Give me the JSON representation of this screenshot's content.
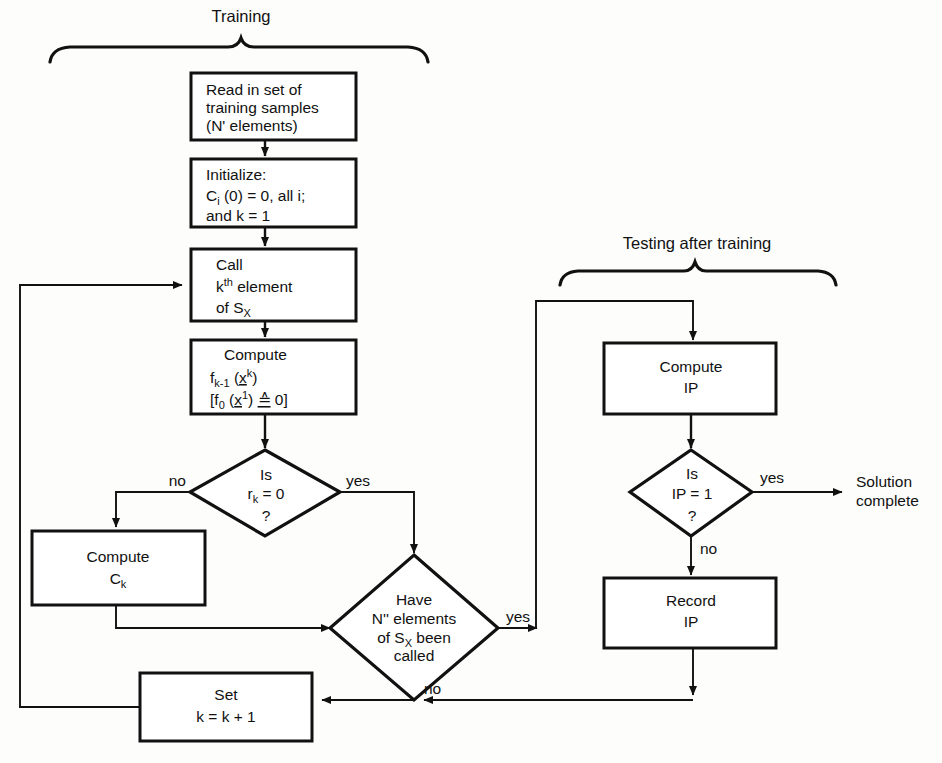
{
  "diagram": {
    "sections": [
      {
        "id": "training",
        "label": "Training"
      },
      {
        "id": "testing",
        "label": "Testing after training"
      }
    ],
    "nodes": {
      "read": {
        "shape": "process",
        "lines": [
          "Read in set of",
          "training samples",
          "(N' elements)"
        ]
      },
      "init": {
        "shape": "process",
        "lines": [
          "Initialize:",
          "C_i (0) = 0, all i;",
          "and k = 1"
        ],
        "line1": "Initialize:",
        "line2_a": "C",
        "line2_sub": "i",
        "line2_b": " (0) = 0, all i;",
        "line3": "and k = 1"
      },
      "call": {
        "shape": "process",
        "line1": "Call",
        "line2_a": "k",
        "line2_sup": "th",
        "line2_b": " element",
        "line3_a": "of S",
        "line3_sub": "X"
      },
      "compute_f": {
        "shape": "process",
        "line1": "Compute",
        "line2_a": "f",
        "line2_sub": "k-1",
        "line2_b": " (x",
        "line2_sup": "k",
        "line2_c": ")",
        "line3_a": "[f",
        "line3_sub": "0",
        "line3_b": " (x",
        "line3_sup": "1",
        "line3_c": ") ",
        "line3_sym": "≙",
        "line3_d": " 0]"
      },
      "dec_rk": {
        "shape": "decision",
        "line1": "Is",
        "line2_a": "r",
        "line2_sub": "k",
        "line2_b": " = 0",
        "line3": "?",
        "branch_left": "no",
        "branch_right": "yes"
      },
      "compute_ck": {
        "shape": "process",
        "line1": "Compute",
        "line2_a": "C",
        "line2_sub": "k"
      },
      "dec_have": {
        "shape": "decision",
        "line1": "Have",
        "line2": "N'' elements",
        "line3_a": "of S",
        "line3_sub": "X",
        "line3_b": " been",
        "line4": "called",
        "branch_right": "yes",
        "branch_bottom": "no"
      },
      "set_k": {
        "shape": "process",
        "line1": "Set",
        "line2": "k = k + 1"
      },
      "compute_ip": {
        "shape": "process",
        "line1": "Compute",
        "line2": "IP"
      },
      "dec_ip": {
        "shape": "decision",
        "line1": "Is",
        "line2": "IP = 1",
        "line3": "?",
        "branch_right": "yes",
        "branch_bottom": "no"
      },
      "record_ip": {
        "shape": "process",
        "line1": "Record",
        "line2": "IP"
      },
      "solution": {
        "shape": "terminal",
        "line1": "Solution",
        "line2": "complete"
      }
    },
    "colors": {
      "stroke": "#111111",
      "fill": "#ffffff",
      "background": "#fdfdfc"
    }
  }
}
